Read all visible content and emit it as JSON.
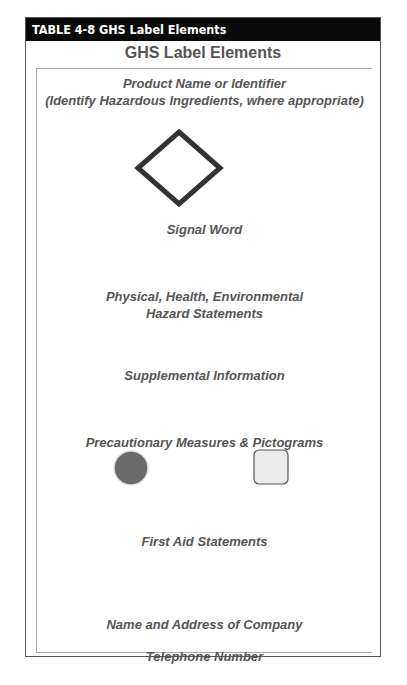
{
  "header": {
    "label": "TABLE 4-8  GHS Label Elements"
  },
  "title": "GHS Label Elements",
  "elements": {
    "product_name": "Product Name or Identifier",
    "product_note": "(Identify Hazardous Ingredients, where appropriate)",
    "signal_word": "Signal Word",
    "hazard_line1": "Physical, Health, Environmental",
    "hazard_line2": "Hazard Statements",
    "supplemental": "Supplemental Information",
    "precautionary": "Precautionary Measures & Pictograms",
    "first_aid": "First Aid Statements",
    "company": "Name and Address of Company",
    "telephone": "Telephone Number"
  },
  "icons": {
    "diamond": "hazard-pictogram-diamond",
    "circle": "precaution-circle",
    "square": "precaution-square"
  },
  "colors": {
    "header_bg": "#0a0a0a",
    "text": "#555555",
    "circle_fill": "#6b6b6b",
    "square_fill": "#ebebeb"
  }
}
